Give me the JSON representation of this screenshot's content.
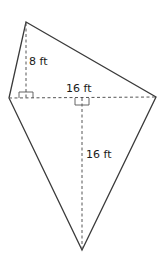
{
  "diagram": {
    "shape": "kite-quadrilateral",
    "vertices": {
      "top": [
        26,
        22
      ],
      "left": [
        9,
        98
      ],
      "right": [
        156,
        97
      ],
      "bottom": [
        82,
        250
      ]
    },
    "colors": {
      "outline": "#3a3a3a",
      "dashed": "#555555",
      "text": "#1a1a1a"
    },
    "labels": {
      "upper_height": "8 ft",
      "diagonal": "16 ft",
      "lower_height": "16 ft"
    }
  }
}
